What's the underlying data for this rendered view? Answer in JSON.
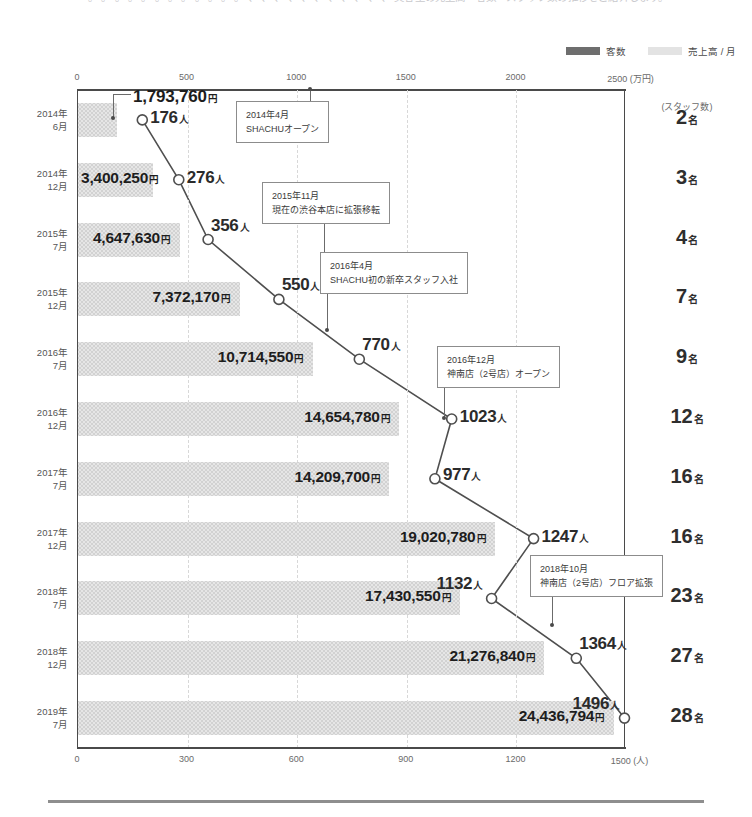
{
  "intro": {
    "clipped_text": "。 。 。 。 。 。 。 。 。 。 。 。 、 、 、 、 、 、 、 、 、 、 、 美容室の売上高・客数・スタッフ数の推移をご紹介します。"
  },
  "legend": {
    "items": [
      {
        "label": "客数",
        "swatch": "dark",
        "color": "#6e6e6e"
      },
      {
        "label": "売上高 / 月",
        "swatch": "light",
        "color": "#e3e3e3"
      }
    ]
  },
  "axes": {
    "top": {
      "unit": "(万円)",
      "ticks": [
        "0",
        "500",
        "1000",
        "1500",
        "2000",
        "2500"
      ],
      "values": [
        0,
        500,
        1000,
        1500,
        2000,
        2500
      ],
      "max": 2500
    },
    "bottom": {
      "unit": "(人)",
      "ticks": [
        "0",
        "300",
        "600",
        "900",
        "1200",
        "1500"
      ],
      "values": [
        0,
        300,
        600,
        900,
        1200,
        1500
      ],
      "max": 1500
    },
    "right_header": "(スタッフ数)"
  },
  "chart_data": {
    "type": "bar",
    "title": "",
    "subtitle": "",
    "xlabel": "",
    "ylabel": "",
    "grid": true,
    "legend_position": "top-right",
    "categories": [
      "2014年\n6月",
      "2014年\n12月",
      "2015年\n7月",
      "2015年\n12月",
      "2016年\n7月",
      "2016年\n12月",
      "2017年\n7月",
      "2017年\n12月",
      "2018年\n7月",
      "2018年\n12月",
      "2019年\n7月"
    ],
    "category_lines": [
      [
        "2014年",
        "6月"
      ],
      [
        "2014年",
        "12月"
      ],
      [
        "2015年",
        "7月"
      ],
      [
        "2015年",
        "12月"
      ],
      [
        "2016年",
        "7月"
      ],
      [
        "2016年",
        "12月"
      ],
      [
        "2017年",
        "7月"
      ],
      [
        "2017年",
        "12月"
      ],
      [
        "2018年",
        "7月"
      ],
      [
        "2018年",
        "12月"
      ],
      [
        "2019年",
        "7月"
      ]
    ],
    "series": [
      {
        "name": "売上高 / 月",
        "unit": "円",
        "type": "bar",
        "axis": "top",
        "values": [
          1793760,
          3400250,
          4647630,
          7372170,
          10714550,
          14654780,
          14209700,
          19020780,
          17430550,
          21276840,
          24436794
        ],
        "labels": [
          "1,793,760",
          "3,400,250",
          "4,647,630",
          "7,372,170",
          "10,714,550",
          "14,654,780",
          "14,209,700",
          "19,020,780",
          "17,430,550",
          "21,276,840",
          "24,436,794"
        ],
        "values_man": [
          179.376,
          340.025,
          464.763,
          737.217,
          1071.455,
          1465.478,
          1420.97,
          1902.078,
          1743.055,
          2127.684,
          2443.6794
        ]
      },
      {
        "name": "客数",
        "unit": "人",
        "type": "line",
        "axis": "bottom",
        "values": [
          176,
          276,
          356,
          550,
          770,
          1023,
          977,
          1247,
          1132,
          1364,
          1496
        ],
        "labels": [
          "176",
          "276",
          "356",
          "550",
          "770",
          "1023",
          "977",
          "1247",
          "1132",
          "1364",
          "1496"
        ]
      },
      {
        "name": "スタッフ数",
        "unit": "名",
        "type": "text",
        "axis": "right",
        "values": [
          2,
          3,
          4,
          7,
          9,
          12,
          16,
          16,
          23,
          27,
          28
        ],
        "labels": [
          "2",
          "3",
          "4",
          "7",
          "9",
          "12",
          "16",
          "16",
          "23",
          "27",
          "28"
        ]
      }
    ],
    "annotations": [
      {
        "date": "2014年4月",
        "text": "SHACHUオープン",
        "anchor_row": 0
      },
      {
        "date": "2015年11月",
        "text": "現在の渋谷本店に拡張移転",
        "anchor_row": 2
      },
      {
        "date": "2016年4月",
        "text": "SHACHU初の新卒スタッフ入社",
        "anchor_row": 4
      },
      {
        "date": "2016年12月",
        "text": "神南店（2号店）オープン",
        "anchor_row": 5
      },
      {
        "date": "2018年10月",
        "text": "神南店（2号店）フロア拡張",
        "anchor_row": 9
      }
    ]
  }
}
